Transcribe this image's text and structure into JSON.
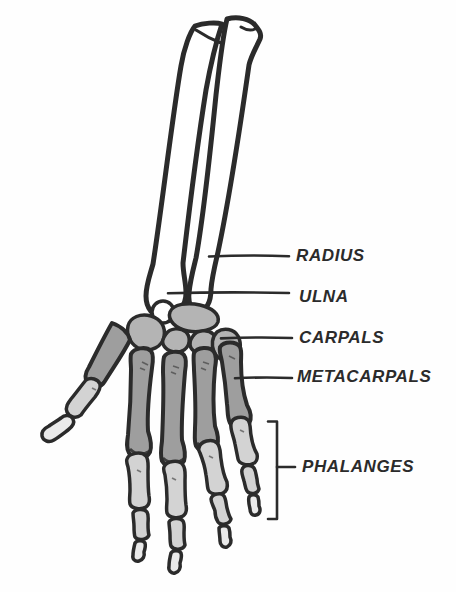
{
  "labels": {
    "radius": "RADIUS",
    "ulna": "ULNA",
    "carpals": "CARPALS",
    "metacarpals": "METACARPALS",
    "phalanges": "PHALANGES"
  },
  "colors": {
    "ink": "#2b2b2b",
    "background": "#fefefe",
    "bone_white": "#ffffff",
    "carpal_fill": "#b4b4b4",
    "metacarpal_fill": "#9e9e9e",
    "phalanx_fill": "#d3d3d3",
    "distal_phalanx_fill": "#eaeaea"
  }
}
